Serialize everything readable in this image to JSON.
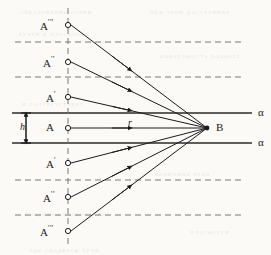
{
  "figure": {
    "type": "ray-diagram",
    "title": "",
    "canvas": {
      "width": 271,
      "height": 255
    },
    "colors": {
      "ink": "#1b1b1b",
      "dashed": "#6b6b6b",
      "solid_axis": "#2a2a2a",
      "paper": "#fbfaf6"
    }
  },
  "axis": {
    "vertical_dashed_x": 68,
    "convergence_point": {
      "label": "B",
      "x": 207,
      "y": 128
    }
  },
  "points": [
    {
      "id": "p1",
      "label": "A",
      "primes": "'''",
      "x": 68,
      "y": 25,
      "label_x": 40,
      "label_y": 19
    },
    {
      "id": "p2",
      "label": "A",
      "primes": "''",
      "x": 68,
      "y": 62,
      "label_x": 43,
      "label_y": 56
    },
    {
      "id": "p3",
      "label": "A",
      "primes": "'",
      "x": 68,
      "y": 97,
      "label_x": 46,
      "label_y": 91
    },
    {
      "id": "p4",
      "label": "A",
      "primes": "",
      "x": 68,
      "y": 128,
      "label_x": 46,
      "label_y": 122
    },
    {
      "id": "p5",
      "label": "A",
      "primes": "'",
      "x": 68,
      "y": 163,
      "label_x": 46,
      "label_y": 157
    },
    {
      "id": "p6",
      "label": "A",
      "primes": "''",
      "x": 68,
      "y": 197,
      "label_x": 43,
      "label_y": 191
    },
    {
      "id": "p7",
      "label": "A",
      "primes": "'''",
      "x": 68,
      "y": 231,
      "label_x": 40,
      "label_y": 225
    }
  ],
  "solid_lines": [
    {
      "id": "alpha-top",
      "y": 113,
      "x1": 12,
      "x2": 252,
      "label": "α",
      "label_x": 258,
      "label_y": 107
    },
    {
      "id": "alpha-bottom",
      "y": 143,
      "x1": 12,
      "x2": 252,
      "label": "α",
      "label_x": 258,
      "label_y": 137
    }
  ],
  "dashed_lines": [
    {
      "id": "dash-1",
      "y": 42,
      "x1": 15,
      "x2": 245
    },
    {
      "id": "dash-2",
      "y": 77,
      "x1": 15,
      "x2": 245
    },
    {
      "id": "dash-3",
      "y": 180,
      "x1": 15,
      "x2": 245
    },
    {
      "id": "dash-4",
      "y": 215,
      "x1": 15,
      "x2": 245
    }
  ],
  "dimension": {
    "label": "h",
    "label_x": 20,
    "label_y": 122,
    "x": 26,
    "y1": 113,
    "y2": 143
  },
  "ray_label": {
    "label": "r",
    "x": 128,
    "y": 118
  },
  "bleed_text": [
    {
      "text": "образование точки",
      "x": 20,
      "y": 8
    },
    {
      "text": "при этом расстояние",
      "x": 150,
      "y": 8
    },
    {
      "text": "лучей в плоскости",
      "x": 18,
      "y": 30
    },
    {
      "text": "поверхность раздела",
      "x": 160,
      "y": 52
    },
    {
      "text": "и соответствует",
      "x": 22,
      "y": 100
    },
    {
      "text": "величина угла",
      "x": 155,
      "y": 170
    },
    {
      "text": "фокусное расстояние",
      "x": 24,
      "y": 210
    },
    {
      "text": "где сходятся лучи",
      "x": 30,
      "y": 246
    },
    {
      "text": "плоскости",
      "x": 190,
      "y": 228
    }
  ]
}
